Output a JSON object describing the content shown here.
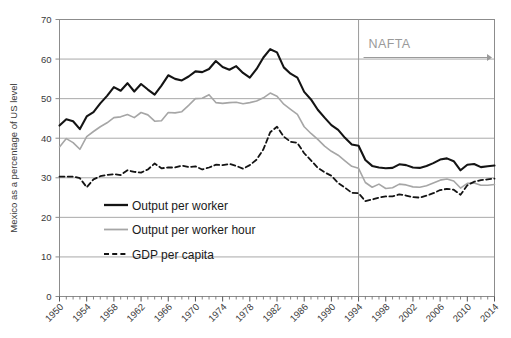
{
  "chart_data": {
    "type": "line",
    "title": "",
    "xlabel": "",
    "ylabel": "Mexico as a percentage of US level",
    "ylim": [
      0,
      70
    ],
    "ytick_values": [
      0,
      10,
      20,
      30,
      40,
      50,
      60,
      70
    ],
    "ytick_labels": [
      "0",
      "10",
      "20",
      "30",
      "40",
      "50",
      "60",
      "70"
    ],
    "xlim": [
      1950,
      2014
    ],
    "xtick_labels": [
      "1950",
      "1954",
      "1958",
      "1962",
      "1966",
      "1970",
      "1974",
      "1978",
      "1982",
      "1986",
      "1990",
      "1994",
      "1998",
      "2002",
      "2006",
      "2010",
      "2014"
    ],
    "xtick_step": 4,
    "minor_tick_step": 1,
    "grid": "horizontal",
    "legend_position": "inside-lower-left",
    "x": [
      1950,
      1951,
      1952,
      1953,
      1954,
      1955,
      1956,
      1957,
      1958,
      1959,
      1960,
      1961,
      1962,
      1963,
      1964,
      1965,
      1966,
      1967,
      1968,
      1969,
      1970,
      1971,
      1972,
      1973,
      1974,
      1975,
      1976,
      1977,
      1978,
      1979,
      1980,
      1981,
      1982,
      1983,
      1984,
      1985,
      1986,
      1987,
      1988,
      1989,
      1990,
      1991,
      1992,
      1993,
      1994,
      1995,
      1996,
      1997,
      1998,
      1999,
      2000,
      2001,
      2002,
      2003,
      2004,
      2005,
      2006,
      2007,
      2008,
      2009,
      2010,
      2011,
      2012,
      2013,
      2014
    ],
    "series": [
      {
        "name": "Output per worker",
        "color": "#141414",
        "style": "solid",
        "width": 2.1,
        "values": [
          43.2,
          44.8,
          44.3,
          42.3,
          45.5,
          46.6,
          48.8,
          50.7,
          52.9,
          52.0,
          53.9,
          51.8,
          53.7,
          52.3,
          51.0,
          53.3,
          55.9,
          55.0,
          54.6,
          55.6,
          56.9,
          56.7,
          57.5,
          59.5,
          58.0,
          57.3,
          58.2,
          56.5,
          55.3,
          57.5,
          60.4,
          62.5,
          61.7,
          57.9,
          56.3,
          55.3,
          51.7,
          49.8,
          47.2,
          45.2,
          43.3,
          42.1,
          40.1,
          38.4,
          38.1,
          34.5,
          33.0,
          32.6,
          32.4,
          32.5,
          33.4,
          33.2,
          32.6,
          32.5,
          33.0,
          33.7,
          34.6,
          34.9,
          34.2,
          31.9,
          33.3,
          33.5,
          32.7,
          32.9,
          33.1
        ]
      },
      {
        "name": "Output per worker hour",
        "color": "#a6a6a6",
        "style": "solid",
        "width": 1.6,
        "values": [
          37.8,
          39.9,
          38.9,
          37.2,
          40.4,
          41.7,
          42.9,
          43.9,
          45.2,
          45.4,
          46.0,
          45.2,
          46.5,
          45.9,
          44.3,
          44.4,
          46.5,
          46.4,
          46.7,
          48.3,
          50.0,
          50.1,
          51.0,
          49.0,
          48.8,
          49.0,
          49.1,
          48.7,
          49.0,
          49.4,
          50.2,
          51.4,
          50.6,
          48.6,
          47.3,
          46.0,
          42.9,
          41.2,
          39.7,
          38.0,
          36.7,
          35.7,
          34.3,
          32.9,
          32.4,
          28.8,
          27.6,
          28.4,
          27.3,
          27.5,
          28.4,
          28.2,
          27.7,
          27.6,
          28.0,
          28.7,
          29.4,
          29.7,
          29.2,
          27.4,
          28.6,
          28.7,
          28.1,
          28.1,
          28.3
        ]
      },
      {
        "name": "GDP per capita",
        "color": "#141414",
        "style": "dashed",
        "width": 1.8,
        "values": [
          30.3,
          30.3,
          30.3,
          29.9,
          27.6,
          29.6,
          30.4,
          30.7,
          30.9,
          30.7,
          31.9,
          31.5,
          31.3,
          32.1,
          33.6,
          32.4,
          32.6,
          32.6,
          33.1,
          32.7,
          32.9,
          32.1,
          32.6,
          33.3,
          33.2,
          33.5,
          33.0,
          32.3,
          33.2,
          34.6,
          37.2,
          41.5,
          42.9,
          40.4,
          39.1,
          38.8,
          36.2,
          34.4,
          32.5,
          31.4,
          30.5,
          28.7,
          27.5,
          26.2,
          26.1,
          24.1,
          24.5,
          25.0,
          25.3,
          25.3,
          25.8,
          25.5,
          25.1,
          25.0,
          25.5,
          26.1,
          26.9,
          27.2,
          27.0,
          25.7,
          28.1,
          29.0,
          29.4,
          29.6,
          29.8
        ]
      }
    ],
    "annotations": [
      {
        "label": "NAFTA",
        "type": "vline-with-arrow",
        "x_value": 1994,
        "arrow_direction": "right",
        "color": "#9a9a9a"
      }
    ]
  },
  "legend": {
    "items": [
      {
        "label": "Output per worker",
        "swatch": "solid-black"
      },
      {
        "label": "Output per worker hour",
        "swatch": "solid-gray"
      },
      {
        "label": "GDP per capita",
        "swatch": "dashed-black"
      }
    ]
  },
  "colors": {
    "background": "#ffffff",
    "grid": "#a9a9a9",
    "frame": "#8c8c8c",
    "text": "#3a3a3a",
    "series_primary": "#141414",
    "series_secondary": "#a6a6a6",
    "annotation": "#9a9a9a"
  }
}
